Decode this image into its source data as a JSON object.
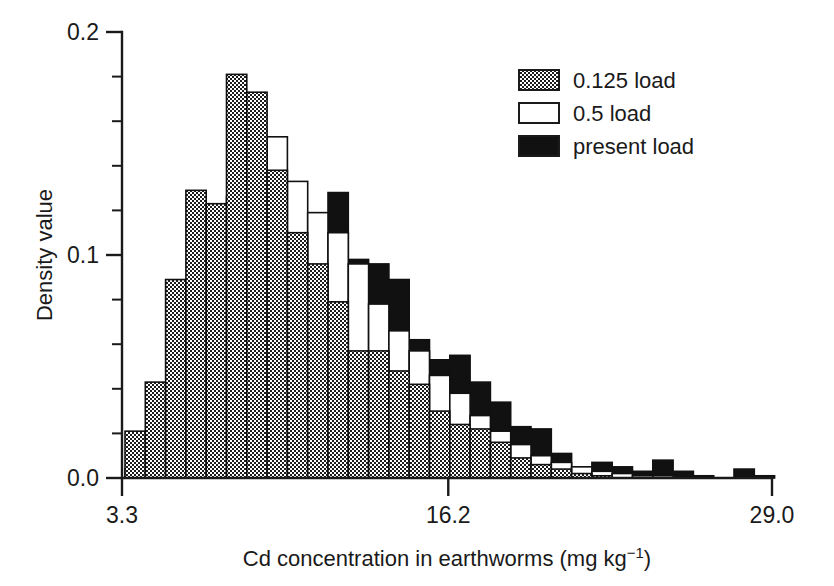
{
  "axes": {
    "y_title": "Density value",
    "x_title_main": "Cd concentration in earthworms (mg kg",
    "x_title_sup": "−1",
    "x_title_tail": ")",
    "y_ticks": [
      "0.0",
      "0.1",
      "0.2"
    ],
    "x_ticks": [
      "3.3",
      "16.2",
      "29.0"
    ]
  },
  "legend": {
    "items": [
      {
        "label": "0.125 load",
        "style": "dotted"
      },
      {
        "label": "0.5 load",
        "style": "white"
      },
      {
        "label": "present load",
        "style": "black"
      }
    ]
  },
  "colors": {
    "ink": "#1a1a1a",
    "black_fill": "#111111",
    "white_fill": "#ffffff",
    "dotted_base": "#6f6f6f"
  },
  "chart_data": {
    "type": "bar",
    "title": "",
    "xlabel": "Cd concentration in earthworms (mg kg-1)",
    "ylabel": "Density value",
    "xlim": [
      3.3,
      29.0
    ],
    "ylim": [
      0.0,
      0.2
    ],
    "grid": false,
    "legend_position": "top-right",
    "bin_width": 0.803,
    "bin_centers": [
      3.7,
      4.5,
      5.3,
      6.1,
      6.9,
      7.7,
      8.5,
      9.3,
      10.1,
      10.9,
      11.7,
      12.5,
      13.3,
      14.1,
      14.9,
      15.7,
      16.5,
      17.3,
      18.1,
      18.9,
      19.7,
      20.5,
      21.3,
      22.1,
      22.9,
      23.7,
      24.5,
      25.3,
      26.1,
      26.9,
      27.7,
      28.5
    ],
    "categories": [
      "3.7",
      "4.5",
      "5.3",
      "6.1",
      "6.9",
      "7.7",
      "8.5",
      "9.3",
      "10.1",
      "10.9",
      "11.7",
      "12.5",
      "13.3",
      "14.1",
      "14.9",
      "15.7",
      "16.5",
      "17.3",
      "18.1",
      "18.9",
      "19.7",
      "20.5",
      "21.3",
      "22.1",
      "22.9",
      "23.7",
      "24.5",
      "25.3",
      "26.1",
      "26.9",
      "27.7",
      "28.5"
    ],
    "series": [
      {
        "name": "0.125 load",
        "style": "dotted",
        "values": [
          0.021,
          0.043,
          0.089,
          0.129,
          0.123,
          0.181,
          0.173,
          0.138,
          0.11,
          0.096,
          0.079,
          0.057,
          0.057,
          0.048,
          0.042,
          0.03,
          0.024,
          0.022,
          0.016,
          0.009,
          0.006,
          0.004,
          0.002,
          0.001,
          0.0,
          0.0,
          0.0,
          0.0,
          0.0,
          0.0,
          0.0,
          0.0
        ]
      },
      {
        "name": "0.5 load",
        "style": "white",
        "values": [
          0.004,
          0.013,
          0.04,
          0.073,
          0.101,
          0.126,
          0.148,
          0.153,
          0.133,
          0.119,
          0.11,
          0.096,
          0.078,
          0.066,
          0.057,
          0.046,
          0.038,
          0.028,
          0.021,
          0.015,
          0.01,
          0.007,
          0.005,
          0.003,
          0.002,
          0.001,
          0.001,
          0.0,
          0.0,
          0.0,
          0.0,
          0.0
        ]
      },
      {
        "name": "present load",
        "style": "black",
        "values": [
          0.0,
          0.001,
          0.004,
          0.014,
          0.032,
          0.056,
          0.08,
          0.1,
          0.109,
          0.112,
          0.128,
          0.098,
          0.096,
          0.089,
          0.062,
          0.053,
          0.055,
          0.043,
          0.034,
          0.023,
          0.022,
          0.011,
          0.005,
          0.007,
          0.005,
          0.003,
          0.008,
          0.003,
          0.001,
          0.0,
          0.004,
          0.001
        ]
      }
    ]
  },
  "geometry": {
    "plot_left": 122,
    "plot_right": 772,
    "plot_top": 32,
    "plot_bottom": 478,
    "bar_origin_x": 125,
    "bar_width": 20.3,
    "n_bins": 32
  }
}
